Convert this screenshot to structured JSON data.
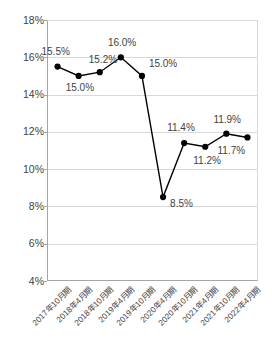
{
  "chart_data": {
    "type": "line",
    "title": "",
    "subtitle": "",
    "xlabel": "",
    "ylabel": "",
    "ylim": [
      4,
      18
    ],
    "ytick_step": 2,
    "ytick_labels": [
      "18%",
      "16%",
      "14%",
      "12%",
      "10%",
      "8%",
      "6%",
      "4%"
    ],
    "ytick_values": [
      18,
      16,
      14,
      12,
      10,
      8,
      6,
      4
    ],
    "grid": true,
    "legend": "none",
    "categories": [
      "2017年10月期",
      "2018年4月期",
      "2018年10月期",
      "2019年4月期",
      "2019年10月期",
      "2020年4月期",
      "2020年10月期",
      "2021年4月期",
      "2021年10月期",
      "2022年4月期"
    ],
    "values": [
      15.5,
      15.0,
      15.2,
      16.0,
      15.0,
      8.5,
      11.4,
      11.2,
      11.9,
      11.7
    ],
    "point_labels": [
      "15.5%",
      "15.0%",
      "15.2%",
      "16.0%",
      "15.0%",
      "8.5%",
      "11.4%",
      "11.2%",
      "11.9%",
      "11.7%"
    ],
    "series": [
      {
        "name": "",
        "values": [
          15.5,
          15.0,
          15.2,
          16.0,
          15.0,
          8.5,
          11.4,
          11.2,
          11.9,
          11.7
        ]
      }
    ]
  },
  "style": {
    "line_color": "#000000",
    "marker_color": "#000000",
    "grid_color": "#d9d9d9",
    "axis_color": "#a6a6a6",
    "text_color": "#3f3f3f",
    "background": "#ffffff"
  }
}
